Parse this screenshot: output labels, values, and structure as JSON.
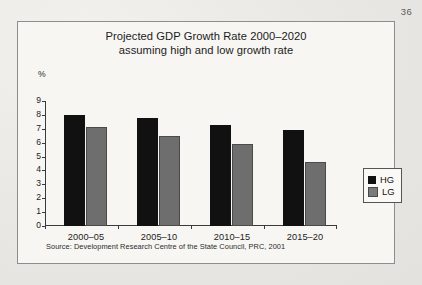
{
  "page": {
    "number": "36"
  },
  "figure": {
    "title_line1": "Projected GDP Growth Rate 2000–2020",
    "title_line2": "assuming high and low growth rate",
    "source": "Source: Development Research Centre of the State Council, PRC, 2001"
  },
  "chart_data": {
    "type": "bar",
    "title": "Projected GDP Growth Rate 2000–2020 assuming high and low growth rate",
    "subtitle": "assuming high and low growth rate",
    "categories": [
      "2000–05",
      "2005–10",
      "2010–15",
      "2015–20"
    ],
    "series": [
      {
        "name": "HG",
        "color": "#111111",
        "values": [
          8.0,
          7.8,
          7.3,
          6.9
        ]
      },
      {
        "name": "LG",
        "color": "#6e6e6e",
        "values": [
          7.1,
          6.5,
          5.9,
          4.6
        ]
      }
    ],
    "xlabel": "",
    "ylabel": "%",
    "ylim": [
      0,
      9
    ],
    "yticks": [
      0,
      1,
      2,
      3,
      4,
      5,
      6,
      7,
      8,
      9
    ],
    "ytick_labels": [
      "0",
      "1",
      "2",
      "3",
      "4",
      "5",
      "6",
      "7",
      "8",
      "9"
    ],
    "grid": false,
    "legend_position": "right",
    "legend": [
      "HG",
      "LG"
    ]
  }
}
